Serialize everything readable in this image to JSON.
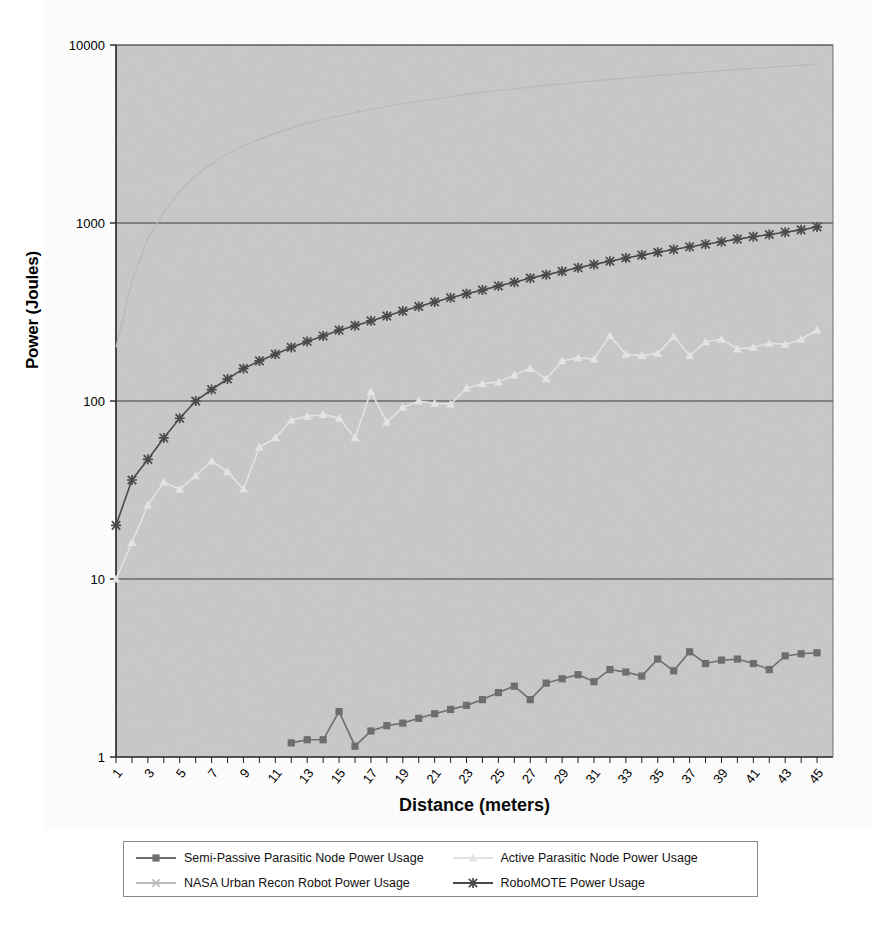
{
  "chart_data": {
    "type": "line",
    "title": "",
    "xlabel": "Distance (meters)",
    "ylabel": "Power (Joules)",
    "yscale": "log",
    "ylim": [
      1,
      10000
    ],
    "ytick_labels": [
      "1",
      "10",
      "100",
      "1000",
      "10000"
    ],
    "ytick_values": [
      1,
      10,
      100,
      1000,
      10000
    ],
    "xlim": [
      1,
      46
    ],
    "xtick_labels": [
      "1",
      "3",
      "5",
      "7",
      "9",
      "11",
      "13",
      "15",
      "17",
      "19",
      "21",
      "23",
      "25",
      "27",
      "29",
      "31",
      "33",
      "35",
      "37",
      "39",
      "41",
      "43",
      "45"
    ],
    "xtick_values": [
      1,
      3,
      5,
      7,
      9,
      11,
      13,
      15,
      17,
      19,
      21,
      23,
      25,
      27,
      29,
      31,
      33,
      35,
      37,
      39,
      41,
      43,
      45
    ],
    "grid": true,
    "grid_axis": "y",
    "legend_position": "bottom",
    "plot_background": "#c8c8c8",
    "x": [
      1,
      2,
      3,
      4,
      5,
      6,
      7,
      8,
      9,
      10,
      11,
      12,
      13,
      14,
      15,
      16,
      17,
      18,
      19,
      20,
      21,
      22,
      23,
      24,
      25,
      26,
      27,
      28,
      29,
      30,
      31,
      32,
      33,
      34,
      35,
      36,
      37,
      38,
      39,
      40,
      41,
      42,
      43,
      44,
      45
    ],
    "series": [
      {
        "name": "Semi-Passive Parasitic Node Power Usage",
        "marker": "square",
        "color": "#6e6e6e",
        "values": [
          null,
          null,
          null,
          null,
          null,
          null,
          null,
          null,
          null,
          null,
          null,
          1.2,
          1.25,
          1.25,
          1.8,
          1.15,
          1.4,
          1.5,
          1.55,
          1.65,
          1.75,
          1.85,
          1.95,
          2.1,
          2.3,
          2.5,
          2.1,
          2.6,
          2.75,
          2.9,
          2.65,
          3.1,
          3.0,
          2.85,
          3.55,
          3.05,
          3.9,
          3.35,
          3.5,
          3.55,
          3.35,
          3.1,
          3.7,
          3.8,
          3.85
        ]
      },
      {
        "name": "Active Parasitic Node Power Usage",
        "marker": "triangle",
        "color": "#e3e3e3",
        "values": [
          10,
          16,
          26,
          35,
          32,
          38,
          46,
          40,
          32,
          55,
          62,
          78,
          82,
          84,
          80,
          62,
          113,
          76,
          92,
          100,
          97,
          96,
          118,
          125,
          128,
          140,
          152,
          133,
          168,
          175,
          172,
          232,
          183,
          180,
          185,
          230,
          180,
          215,
          222,
          196,
          200,
          211,
          208,
          222,
          250
        ]
      },
      {
        "name": "NASA Urban Recon Robot Power Usage",
        "marker": "x",
        "color": "#b9b9b9",
        "values": [
          200,
          470,
          820,
          1150,
          1500,
          1850,
          2150,
          2450,
          2700,
          2950,
          3200,
          3420,
          3620,
          3820,
          4000,
          4180,
          4350,
          4520,
          4680,
          4830,
          4980,
          5130,
          5270,
          5410,
          5540,
          5670,
          5800,
          5920,
          6050,
          6170,
          6290,
          6400,
          6520,
          6630,
          6740,
          6850,
          6960,
          7070,
          7180,
          7280,
          7390,
          7490,
          7600,
          7700,
          7800
        ]
      },
      {
        "name": "RoboMOTE Power Usage",
        "marker": "asterisk",
        "color": "#4a4a4a",
        "values": [
          20,
          36,
          47,
          62,
          80,
          100,
          116,
          133,
          152,
          168,
          183,
          200,
          216,
          232,
          250,
          265,
          282,
          300,
          320,
          340,
          360,
          380,
          400,
          420,
          443,
          465,
          490,
          512,
          535,
          560,
          585,
          610,
          636,
          660,
          685,
          710,
          735,
          760,
          785,
          812,
          838,
          862,
          888,
          915,
          950
        ]
      }
    ]
  }
}
